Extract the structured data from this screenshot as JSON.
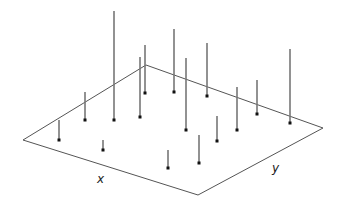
{
  "chart_data": {
    "type": "stem3d",
    "title": "",
    "xlabel": "x",
    "ylabel": "y",
    "zlabel": "",
    "grid": false,
    "legend": null,
    "colors": {
      "stem": "#777777",
      "marker": "#111111",
      "plane": "#555555",
      "background": "#ffffff"
    },
    "plane_corners_px": [
      [
        23,
        140
      ],
      [
        146,
        65
      ],
      [
        323,
        128
      ],
      [
        198,
        195
      ]
    ],
    "stems": [
      {
        "base": [
          59,
          140
        ],
        "top": 120
      },
      {
        "base": [
          85,
          120
        ],
        "top": 92
      },
      {
        "base": [
          114,
          120
        ],
        "top": 11
      },
      {
        "base": [
          140,
          117
        ],
        "top": 57
      },
      {
        "base": [
          145,
          93
        ],
        "top": 45
      },
      {
        "base": [
          174,
          92
        ],
        "top": 29
      },
      {
        "base": [
          207,
          96
        ],
        "top": 43
      },
      {
        "base": [
          186,
          130
        ],
        "top": 58
      },
      {
        "base": [
          217,
          141
        ],
        "top": 116
      },
      {
        "base": [
          237,
          130
        ],
        "top": 87
      },
      {
        "base": [
          257,
          114
        ],
        "top": 80
      },
      {
        "base": [
          290,
          123
        ],
        "top": 49
      },
      {
        "base": [
          103,
          150
        ],
        "top": 140
      },
      {
        "base": [
          168,
          168
        ],
        "top": 150
      },
      {
        "base": [
          199,
          163
        ],
        "top": 135
      }
    ]
  },
  "labels": {
    "x": "x",
    "y": "y"
  }
}
